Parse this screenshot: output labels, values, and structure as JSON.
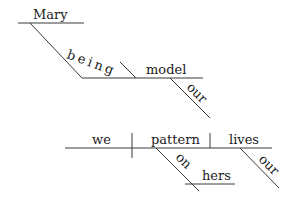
{
  "diagram": {
    "type": "Reed-Kellogg sentence diagram",
    "clause1": {
      "subject_complement_word": "Mary",
      "participle": "being",
      "complement": "model",
      "modifier_model": "our"
    },
    "clause2": {
      "subject": "we",
      "verb": "pattern",
      "object": "lives",
      "preposition": "on",
      "prep_object": "hers",
      "modifier_lives": "our"
    }
  }
}
